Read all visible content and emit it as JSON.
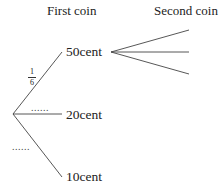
{
  "headers": {
    "first": "First coin",
    "second": "Second coin"
  },
  "first_coin": {
    "branches": [
      {
        "label": "50cent",
        "probability": {
          "numerator": "1",
          "denominator": "6"
        }
      },
      {
        "label": "20cent",
        "probability_placeholder": "......"
      },
      {
        "label": "10cent",
        "probability_placeholder": "......"
      }
    ]
  },
  "second_coin": {
    "branch_count": 3
  },
  "colors": {
    "line": "#444444",
    "text": "#222222"
  }
}
